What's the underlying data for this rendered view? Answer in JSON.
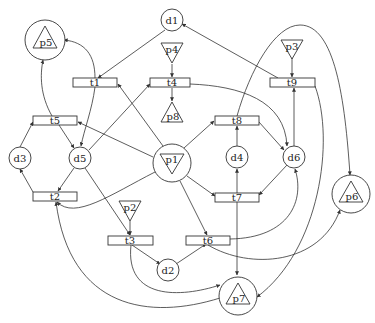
{
  "diagram": {
    "type": "petri-net",
    "places": [
      {
        "id": "d1",
        "label": "d1",
        "kind": "circle",
        "x": 172,
        "y": 20
      },
      {
        "id": "d2",
        "label": "d2",
        "kind": "circle",
        "x": 168,
        "y": 270
      },
      {
        "id": "d3",
        "label": "d3",
        "kind": "circle",
        "x": 20,
        "y": 158
      },
      {
        "id": "d4",
        "label": "d4",
        "kind": "circle",
        "x": 237,
        "y": 157
      },
      {
        "id": "d5",
        "label": "d5",
        "kind": "circle",
        "x": 80,
        "y": 158
      },
      {
        "id": "d6",
        "label": "d6",
        "kind": "circle",
        "x": 294,
        "y": 157
      },
      {
        "id": "p1",
        "label": "p1",
        "kind": "circle-triangle-down",
        "x": 172,
        "y": 163
      },
      {
        "id": "p2",
        "label": "p2",
        "kind": "triangle-down",
        "x": 130,
        "y": 210
      },
      {
        "id": "p3",
        "label": "p3",
        "kind": "triangle-down",
        "x": 292,
        "y": 45
      },
      {
        "id": "p4",
        "label": "p4",
        "kind": "triangle-down",
        "x": 172,
        "y": 52
      },
      {
        "id": "p5",
        "label": "p5",
        "kind": "circle-triangle-up",
        "x": 45,
        "y": 40
      },
      {
        "id": "p6",
        "label": "p6",
        "kind": "circle-triangle-up",
        "x": 351,
        "y": 194
      },
      {
        "id": "p7",
        "label": "p7",
        "kind": "circle-triangle-up",
        "x": 238,
        "y": 295
      },
      {
        "id": "p8",
        "label": "p8",
        "kind": "triangle-up",
        "x": 172,
        "y": 112
      }
    ],
    "transitions": [
      {
        "id": "t1",
        "label": "t1",
        "x": 95,
        "y": 82
      },
      {
        "id": "t2",
        "label": "t2",
        "x": 55,
        "y": 196
      },
      {
        "id": "t3",
        "label": "t3",
        "x": 130,
        "y": 240
      },
      {
        "id": "t4",
        "label": "t4",
        "x": 172,
        "y": 82
      },
      {
        "id": "t5",
        "label": "t5",
        "x": 55,
        "y": 120
      },
      {
        "id": "t6",
        "label": "t6",
        "x": 208,
        "y": 240
      },
      {
        "id": "t7",
        "label": "t7",
        "x": 237,
        "y": 197
      },
      {
        "id": "t8",
        "label": "t8",
        "x": 237,
        "y": 120
      },
      {
        "id": "t9",
        "label": "t9",
        "x": 292,
        "y": 82
      }
    ],
    "arcs": [
      [
        "d1",
        "t1"
      ],
      [
        "t9",
        "d1"
      ],
      [
        "p4",
        "t4"
      ],
      [
        "t4",
        "p8"
      ],
      [
        "p3",
        "t9"
      ],
      [
        "t1",
        "p5"
      ],
      [
        "t1",
        "d5"
      ],
      [
        "t5",
        "p5"
      ],
      [
        "t5",
        "d5"
      ],
      [
        "d3",
        "t5"
      ],
      [
        "d5",
        "t4"
      ],
      [
        "p1",
        "t1"
      ],
      [
        "p1",
        "t5"
      ],
      [
        "t4",
        "d6"
      ],
      [
        "p1",
        "t8"
      ],
      [
        "d4",
        "t8"
      ],
      [
        "t8",
        "d6"
      ],
      [
        "d6",
        "t9"
      ],
      [
        "t8",
        "p6"
      ],
      [
        "t9",
        "p7"
      ],
      [
        "d5",
        "t2"
      ],
      [
        "t2",
        "d3"
      ],
      [
        "p1",
        "t2"
      ],
      [
        "p1",
        "t7"
      ],
      [
        "d6",
        "t7"
      ],
      [
        "t7",
        "d4"
      ],
      [
        "t7",
        "p7"
      ],
      [
        "p1",
        "t6"
      ],
      [
        "t6",
        "d6"
      ],
      [
        "t6",
        "p6"
      ],
      [
        "d5",
        "t3"
      ],
      [
        "p2",
        "t3"
      ],
      [
        "t3",
        "d2"
      ],
      [
        "d2",
        "t6"
      ],
      [
        "t3",
        "p7"
      ],
      [
        "p7",
        "t2"
      ]
    ]
  }
}
